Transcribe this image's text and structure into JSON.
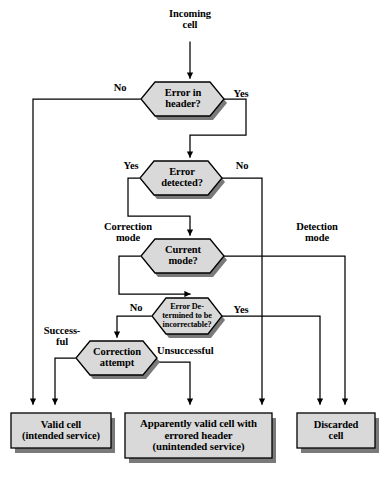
{
  "diagram": {
    "colors": {
      "node_fill": "#d9d9d9",
      "node_stroke": "#000000",
      "shadow": "#7a7a7a",
      "line": "#000000",
      "background": "#ffffff"
    },
    "start_label": "Incoming\ncell",
    "decisions": [
      {
        "id": "error_in_header",
        "label": "Error in\nheader?",
        "shape": "hexagon"
      },
      {
        "id": "error_detected",
        "label": "Error\ndetected?",
        "shape": "hexagon"
      },
      {
        "id": "current_mode",
        "label": "Current\nmode?",
        "shape": "hexagon"
      },
      {
        "id": "incorrectable",
        "label": "Error De-\ntermined to be\nincorrectable?",
        "shape": "hexagon"
      },
      {
        "id": "correction_attempt",
        "label": "Correction\nattempt",
        "shape": "hexagon"
      }
    ],
    "edge_labels": [
      {
        "id": "header_no",
        "text": "No"
      },
      {
        "id": "header_yes",
        "text": "Yes"
      },
      {
        "id": "detected_yes",
        "text": "Yes"
      },
      {
        "id": "detected_no",
        "text": "No"
      },
      {
        "id": "correction_mode",
        "text": "Correction\nmode"
      },
      {
        "id": "detection_mode",
        "text": "Detection\nmode"
      },
      {
        "id": "incorrectable_no",
        "text": "No"
      },
      {
        "id": "incorrectable_yes",
        "text": "Yes"
      },
      {
        "id": "successful",
        "text": "Success-\nful"
      },
      {
        "id": "unsuccessful",
        "text": "Unsuccessful"
      }
    ],
    "terminals": [
      {
        "id": "valid_cell",
        "label": "Valid cell\n(intended service)"
      },
      {
        "id": "apparently_valid",
        "label": "Apparently valid cell with\nerrored header\n(unintended service)"
      },
      {
        "id": "discarded_cell",
        "label": "Discarded\ncell"
      }
    ]
  }
}
